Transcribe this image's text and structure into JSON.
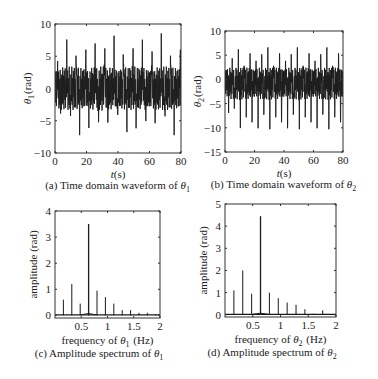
{
  "chart_data": [
    {
      "id": "a",
      "type": "line",
      "caption": "(a) Time domain waveform of θ",
      "caption_sub": "1",
      "xlabel": "t(s)",
      "ylabel": "θ",
      "ylabel_sub": "1",
      "ylabel_unit": "(rad)",
      "xlim": [
        0,
        80
      ],
      "ylim": [
        -10,
        10
      ],
      "xticks": [
        0,
        20,
        40,
        60,
        80
      ],
      "yticks": [
        -10,
        -5,
        0,
        5,
        10
      ],
      "grid": false,
      "signal": {
        "description": "quasi-periodic oscillation",
        "max_peak": 7.5,
        "min_trough": -6.2,
        "dominant_period_s": 6.0,
        "start_amplitude": 4
      },
      "box": {
        "left": 55,
        "top": 24,
        "right": 181,
        "bottom": 153
      }
    },
    {
      "id": "b",
      "type": "line",
      "caption": "(b) Time domain waveform of θ",
      "caption_sub": "2",
      "xlabel": "t(s)",
      "ylabel": "θ",
      "ylabel_sub": "2",
      "ylabel_unit": "(rad)",
      "xlim": [
        0,
        80
      ],
      "ylim": [
        -15,
        10
      ],
      "xticks": [
        0,
        20,
        40,
        60,
        80
      ],
      "yticks": [
        -15,
        -10,
        -5,
        0,
        5,
        10
      ],
      "grid": false,
      "signal": {
        "description": "quasi-periodic oscillation",
        "max_peak": 7.0,
        "typical_peak": 5,
        "min_trough": -9.8,
        "dominant_period_s": 4.0,
        "start_amplitude": 4
      },
      "box": {
        "left": 225,
        "top": 31,
        "right": 343,
        "bottom": 152
      }
    },
    {
      "id": "c",
      "type": "bar",
      "caption": "(c) Amplitude spectrum of θ",
      "caption_sub": "1",
      "xlabel": "frequency of θ",
      "xlabel_sub": "1",
      "xlabel_unit": "(Hz)",
      "ylabel": "amplitude (rad)",
      "xlim": [
        0,
        2
      ],
      "ylim": [
        -0.1,
        4
      ],
      "xticks": [
        0.5,
        1,
        1.5,
        2
      ],
      "xticklabels": [
        "0.5",
        "1",
        "1.5",
        "2"
      ],
      "yticks": [
        0,
        1,
        2,
        3,
        4
      ],
      "grid": false,
      "x": [
        0.16,
        0.32,
        0.48,
        0.64,
        0.8,
        0.96,
        1.12,
        1.28,
        1.44,
        1.6,
        1.76,
        1.92
      ],
      "values": [
        0.6,
        1.2,
        0.45,
        3.5,
        0.95,
        0.7,
        0.45,
        0.2,
        0.2,
        0.1,
        0.1,
        0.05
      ],
      "box": {
        "left": 55,
        "top": 211,
        "right": 160,
        "bottom": 318
      }
    },
    {
      "id": "d",
      "type": "bar",
      "caption": "(d) Amplitude spectrum of θ",
      "caption_sub": "2",
      "xlabel": "frequency of θ",
      "xlabel_sub": "2",
      "xlabel_unit": "(Hz)",
      "ylabel": "amplitude (rad)",
      "xlim": [
        0,
        2
      ],
      "ylim": [
        -0.1,
        5
      ],
      "xticks": [
        0.5,
        1,
        1.5,
        2
      ],
      "xticklabels": [
        "0.5",
        "1",
        "1.5",
        "2"
      ],
      "yticks": [
        0,
        1,
        2,
        3,
        4,
        5
      ],
      "grid": false,
      "x": [
        0.16,
        0.32,
        0.48,
        0.64,
        0.8,
        0.96,
        1.12,
        1.28,
        1.44,
        1.6,
        1.76
      ],
      "values": [
        1.1,
        2.0,
        0.95,
        4.45,
        1.0,
        0.75,
        0.55,
        0.45,
        0.25,
        0.05,
        0.2
      ],
      "box": {
        "left": 225,
        "top": 204,
        "right": 336,
        "bottom": 317
      }
    }
  ],
  "colors": {
    "line": "#1a1a1a",
    "axis": "#333333",
    "background": "#ffffff"
  }
}
